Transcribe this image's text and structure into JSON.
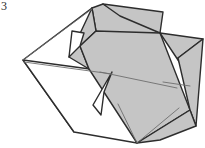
{
  "figure": {
    "kind": "origami-fold-diagram",
    "step_number": "3",
    "canvas": {
      "width": 205,
      "height": 148
    },
    "colors": {
      "background": "#ffffff",
      "shaded_face": "#c5c5c5",
      "shaded_face_dark": "#b8b8b8",
      "white_face": "#ffffff",
      "outline": "#2d2d2d",
      "crease_line": "#6e6e6e",
      "step_label": "#2b2b2b"
    },
    "stroke": {
      "outline_width": 1.4,
      "inner_width": 1.1,
      "crease_width": 0.9
    },
    "shapes": [
      {
        "name": "left-white-flap",
        "fill": "white_face",
        "stroke": "outline",
        "points": "23,60 92,8 112,72 74,132"
      },
      {
        "name": "lower-white-wedge",
        "fill": "white_face",
        "stroke": "outline",
        "points": "23,60 112,72 137,143 74,132"
      },
      {
        "name": "top-shaded-panel",
        "fill": "shaded_face",
        "stroke": "outline",
        "points": "92,8 103,4 160,33 120,44 96,31"
      },
      {
        "name": "top-right-shaded-wing",
        "fill": "shaded_face",
        "stroke": "outline",
        "points": "103,4 163,12 160,33 120,16"
      },
      {
        "name": "upper-mid-shaded-body",
        "fill": "shaded_face",
        "stroke": "outline",
        "points": "92,8 96,31 80,46 89,69 69,57"
      },
      {
        "name": "main-shaded-body",
        "fill": "shaded_face",
        "stroke": "outline",
        "points": "96,31 160,33 190,110 137,143 89,69 80,46"
      },
      {
        "name": "right-tail-upper",
        "fill": "shaded_face",
        "stroke": "outline",
        "points": "160,33 203,39 178,58 190,78"
      },
      {
        "name": "right-tail-lower",
        "fill": "shaded_face",
        "stroke": "outline",
        "points": "178,58 203,39 196,126 190,110"
      },
      {
        "name": "bottom-fin-shaded",
        "fill": "shaded_face",
        "stroke": "outline",
        "points": "137,143 190,110 196,126 160,140"
      },
      {
        "name": "notch-upper-white",
        "fill": "white_face",
        "stroke": "outline",
        "points": "69,57 80,46 84,33 72,31"
      },
      {
        "name": "notch-lower-white",
        "fill": "white_face",
        "stroke": "outline",
        "points": "112,72 104,92 101,115 93,105"
      }
    ],
    "creases": [
      {
        "name": "body-centre-crease",
        "x1": 100,
        "y1": 72,
        "x2": 177,
        "y2": 88
      },
      {
        "name": "tail-inner-crease",
        "x1": 163,
        "y1": 82,
        "x2": 190,
        "y2": 86
      },
      {
        "name": "left-top-edge-crease",
        "x1": 23,
        "y1": 60,
        "x2": 92,
        "y2": 9
      },
      {
        "name": "left-fold-crease",
        "x1": 24,
        "y1": 62,
        "x2": 112,
        "y2": 74
      },
      {
        "name": "lower-body-crease",
        "x1": 137,
        "y1": 143,
        "x2": 118,
        "y2": 104
      },
      {
        "name": "lower-right-crease",
        "x1": 137,
        "y1": 143,
        "x2": 179,
        "y2": 108
      }
    ]
  }
}
